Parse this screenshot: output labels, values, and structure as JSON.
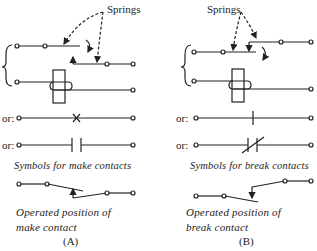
{
  "diagram": {
    "panel_a": {
      "springs_label": "Springs",
      "or_label_1": "or:",
      "or_label_2": "or:",
      "caption_symbols": "Symbols for make contacts",
      "caption_operated_line1": "Operated position of",
      "caption_operated_line2": "make contact",
      "figure_label": "(A)"
    },
    "panel_b": {
      "springs_label": "Springs",
      "or_label_1": "or:",
      "or_label_2": "or:",
      "caption_symbols": "Symbols for break contacts",
      "caption_operated_line1": "Operated position of",
      "caption_operated_line2": "break contact",
      "figure_label": "(B)"
    },
    "colors": {
      "ink": "#222222",
      "background": "#ffffff"
    }
  }
}
